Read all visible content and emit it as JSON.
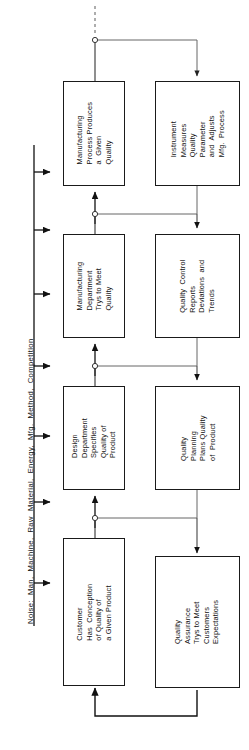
{
  "diagram": {
    "orientation": "rotated-90-counterclockwise",
    "noise_axis": {
      "label": "Noise:  Man,  Machine,  Raw  Material,  Energy,  Mfg.  Method,  Competition",
      "arrow_count": 7
    },
    "boxes": [
      {
        "id": "manufacturing-process",
        "text": "Manufacturing\nProcess Produces\na  Given\nQuality"
      },
      {
        "id": "instrument-measures",
        "text": "Instrument\nMeasures\nQuality\nParameter\nand  Adjusts\nMfg.  Process"
      },
      {
        "id": "manufacturing-department",
        "text": "Manufacturing\nDepartment\nTrys to Meet\nQuality"
      },
      {
        "id": "quality-control",
        "text": "Quality  Control\nReports\nDeviations  and\nTrends"
      },
      {
        "id": "design-department",
        "text": "Design\nDepartment\nSpecifies\nQuality of\nProduct"
      },
      {
        "id": "quality-planning",
        "text": "Quality\nPlanning\nPlans Quality\nof  Product"
      },
      {
        "id": "customer-conception",
        "text": "Customer\nHas  Conception\nof Quality of\na Given Product"
      },
      {
        "id": "quality-assurance",
        "text": "Quality\nAssurance\nTrys to Meet\nCustomers\nExpectations"
      }
    ],
    "colors": {
      "stroke": "#1a1a1a",
      "thin_stroke": "#555555",
      "background": "#ffffff"
    }
  }
}
